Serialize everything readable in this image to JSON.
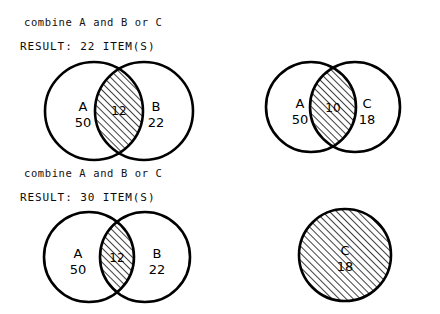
{
  "canvas": {
    "width": 440,
    "height": 314,
    "background": "#ffffff"
  },
  "style": {
    "stroke_color": "#000000",
    "hatch_color": "#000000",
    "text_color": "#000000",
    "circle_stroke_width": 2.6,
    "hatch_spacing": 5,
    "hatch_direction": "forward-slash"
  },
  "blocks": [
    {
      "query": "combine A and B or C",
      "result": "RESULT: 22 ITEM(S)",
      "diagrams": [
        {
          "kind": "two-set-venn",
          "left_label": "A",
          "left_count": "50",
          "right_label": "B",
          "right_count": "22",
          "intersection_count": "12",
          "intersection_shaded": true,
          "left_shaded": false,
          "right_shaded": false
        },
        {
          "kind": "two-set-venn",
          "left_label": "A",
          "left_count": "50",
          "right_label": "C",
          "right_count": "18",
          "intersection_count": "10",
          "intersection_shaded": true,
          "left_shaded": false,
          "right_shaded": false
        }
      ]
    },
    {
      "query": "combine A and B or C",
      "result": "RESULT: 30 ITEM(S)",
      "diagrams": [
        {
          "kind": "two-set-venn",
          "left_label": "A",
          "left_count": "50",
          "right_label": "B",
          "right_count": "22",
          "intersection_count": "12",
          "intersection_shaded": true,
          "left_shaded": false,
          "right_shaded": false
        },
        {
          "kind": "single-set-circle",
          "label": "C",
          "count": "18",
          "shaded": true
        }
      ]
    }
  ]
}
